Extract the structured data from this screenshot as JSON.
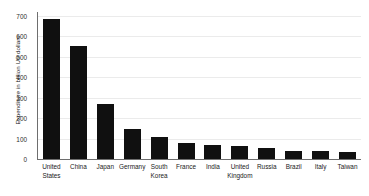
{
  "chart_data": {
    "type": "bar",
    "title": "",
    "subtitle": "",
    "xlabel": "",
    "ylabel": "Expenditure in billion US dollars",
    "categories": [
      "United States",
      "China",
      "Japan",
      "Germany",
      "South Korea",
      "France",
      "India",
      "United Kingdom",
      "Russia",
      "Brazil",
      "Italy",
      "Taiwan"
    ],
    "category_lines": [
      [
        "United",
        "States"
      ],
      [
        "China",
        ""
      ],
      [
        "Japan",
        ""
      ],
      [
        "Germany",
        ""
      ],
      [
        "South",
        "Korea"
      ],
      [
        "France",
        ""
      ],
      [
        "India",
        ""
      ],
      [
        "United",
        "Kingdom"
      ],
      [
        "Russia",
        ""
      ],
      [
        "Brazil",
        ""
      ],
      [
        "Italy",
        ""
      ],
      [
        "Taiwan",
        ""
      ]
    ],
    "values": [
      685,
      555,
      270,
      145,
      107,
      77,
      68,
      62,
      53,
      41,
      40,
      35
    ],
    "ylim": [
      0,
      700
    ],
    "yticks": [
      0,
      100,
      200,
      300,
      400,
      500,
      600,
      700
    ],
    "ytick_labels": [
      "0",
      "100",
      "200",
      "300",
      "400",
      "500",
      "600",
      "700"
    ],
    "grid": true,
    "grid_axis": "y",
    "legend": false,
    "legend_position": "none",
    "bar_color": "#101010",
    "grid_color": "#ebebeb",
    "axis_color": "#6e6e6e",
    "background_color": "#ffffff"
  }
}
